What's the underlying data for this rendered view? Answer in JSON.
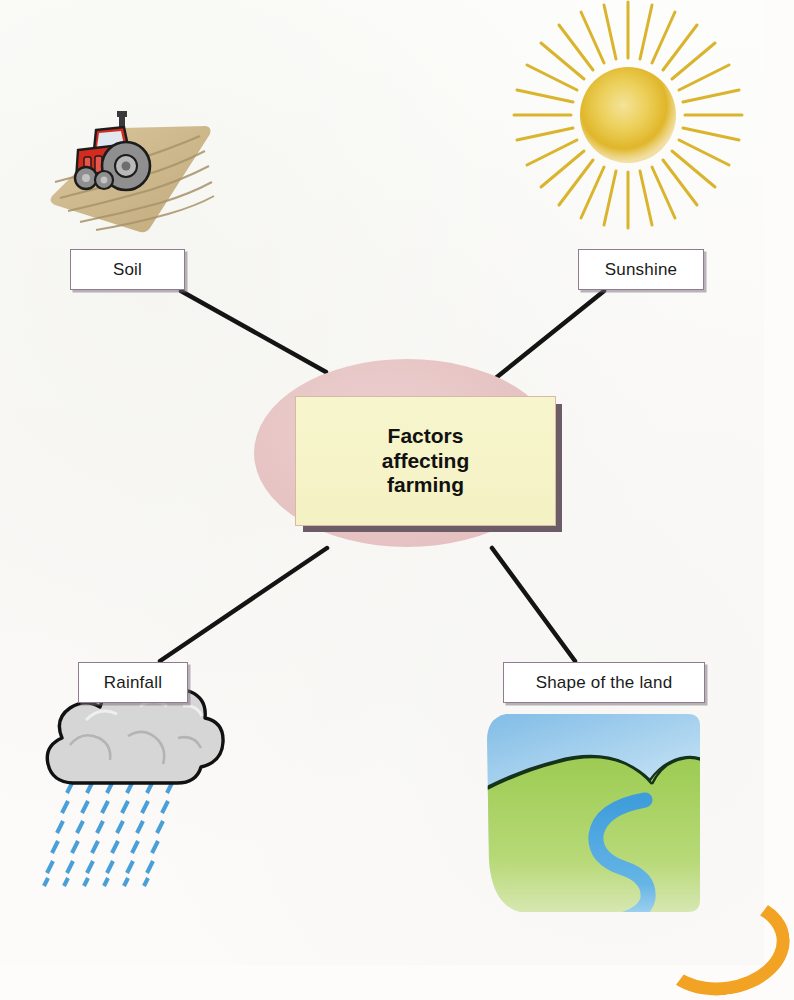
{
  "diagram": {
    "type": "spider-concept-map",
    "center": {
      "text_lines": [
        "Factors",
        "affecting",
        "farming"
      ],
      "text": "Factors affecting farming",
      "shape": "ellipse-with-inner-rectangle",
      "ellipse_color": "#e7c4c4",
      "box_color": "#f4f2c4",
      "box_shadow_color": "#6b5c66"
    },
    "nodes": [
      {
        "id": "soil",
        "label": "Soil",
        "image": "tractor-ploughed-field-image",
        "position": "top-left"
      },
      {
        "id": "sunshine",
        "label": "Sunshine",
        "image": "sun-with-rays-image",
        "position": "top-right"
      },
      {
        "id": "rainfall",
        "label": "Rainfall",
        "image": "rain-cloud-image",
        "position": "bottom-left"
      },
      {
        "id": "shape",
        "label": "Shape of the land",
        "image": "hills-with-river-image",
        "position": "bottom-right"
      }
    ],
    "connectors": [
      {
        "from": "soil",
        "to": "center",
        "color": "#141414"
      },
      {
        "from": "sunshine",
        "to": "center",
        "color": "#141414"
      },
      {
        "from": "rainfall",
        "to": "center",
        "color": "#141414"
      },
      {
        "from": "shape",
        "to": "center",
        "color": "#141414"
      }
    ],
    "colors": {
      "background": "#fdfcfa",
      "line": "#141414",
      "label_border": "#8d7d8d",
      "sun": "#e3bb2e",
      "field": "#cdb88c",
      "tractor": "#d42b1f",
      "cloud": "#d3d3d3",
      "rain": "#4a9fd8",
      "hills": "#9ccb52",
      "river": "#4aa3dd",
      "sky": "#8dc3e8",
      "corner_accent": "#f2a324"
    }
  }
}
